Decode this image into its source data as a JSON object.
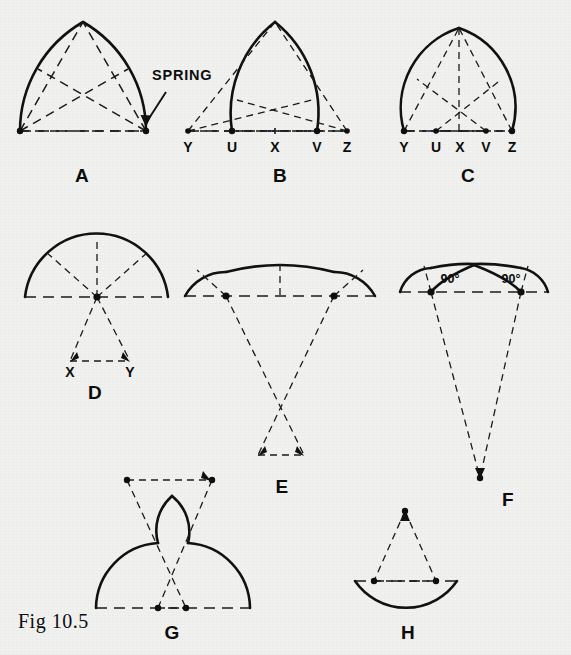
{
  "figure": {
    "caption": "Fig 10.5",
    "background_color": "#f1f1ef",
    "ink_color": "#101010",
    "callouts": [
      {
        "id": "spring",
        "text": "SPRING"
      }
    ],
    "panels": [
      {
        "id": "A",
        "label": "A",
        "description": "Equilateral pointed arch with crossing construction chords",
        "point_labels": []
      },
      {
        "id": "B",
        "label": "B",
        "description": "Lancet (drop) pointed arch struck from centres beyond the springing",
        "point_labels": [
          "Y",
          "U",
          "X",
          "V",
          "Z"
        ]
      },
      {
        "id": "C",
        "label": "C",
        "description": "Drop pointed arch struck from centres inside the span",
        "point_labels": [
          "Y",
          "U",
          "X",
          "V",
          "Z"
        ]
      },
      {
        "id": "D",
        "label": "D",
        "description": "Segmental three-centred arch with centres below the springing line",
        "point_labels": [
          "X",
          "Y"
        ]
      },
      {
        "id": "E",
        "label": "E",
        "description": "Flat three-centred arch with deep centres below the springing line",
        "point_labels": []
      },
      {
        "id": "F",
        "label": "F",
        "description": "Four-centred depressed arch with right-angle tangent construction",
        "point_labels": [],
        "angle_labels": [
          "90°",
          "90°"
        ]
      },
      {
        "id": "G",
        "label": "G",
        "description": "Ogee arch struck from reversed centres above and below the springing",
        "point_labels": []
      },
      {
        "id": "H",
        "label": "H",
        "description": "Inverted segmental arch struck from a centre above the springing line",
        "point_labels": []
      }
    ]
  },
  "geometry": {
    "A": {
      "spring_left": [
        20,
        131
      ],
      "spring_right": [
        146,
        131
      ],
      "apex": [
        83,
        22
      ],
      "baseline_left": [
        20,
        131
      ],
      "baseline_right": [
        146,
        131
      ],
      "callout_text_pos": [
        152,
        84
      ],
      "callout_arrow_from": [
        168,
        92
      ],
      "callout_arrow_to": [
        145,
        126
      ],
      "letter_pos": [
        82,
        176
      ]
    },
    "B": {
      "spring_left": [
        232,
        131
      ],
      "spring_right": [
        317,
        131
      ],
      "apex": [
        275,
        22
      ],
      "center_far_left": [
        188,
        131
      ],
      "center_far_right": [
        347,
        131
      ],
      "labels": {
        "Y": [
          188,
          152
        ],
        "U": [
          232,
          152
        ],
        "X": [
          275,
          152
        ],
        "V": [
          317,
          152
        ],
        "Z": [
          347,
          152
        ]
      },
      "letter_pos": [
        280,
        176
      ]
    },
    "C": {
      "spring_left": [
        404,
        131
      ],
      "spring_right": [
        512,
        131
      ],
      "apex": [
        459,
        28
      ],
      "center_left": [
        436,
        131
      ],
      "center_right": [
        486,
        131
      ],
      "labels": {
        "Y": [
          404,
          152
        ],
        "U": [
          436,
          152
        ],
        "X": [
          460,
          152
        ],
        "V": [
          486,
          152
        ],
        "Z": [
          512,
          152
        ]
      },
      "letter_pos": [
        468,
        176
      ]
    },
    "D": {
      "spring_left": [
        25,
        297
      ],
      "spring_right": [
        168,
        297
      ],
      "apex": [
        97,
        241
      ],
      "centre": [
        97,
        297
      ],
      "labels": {
        "X": [
          70,
          375
        ],
        "Y": [
          130,
          375
        ]
      },
      "lower_left": [
        70,
        361
      ],
      "lower_right": [
        130,
        361
      ],
      "letter_pos": [
        95,
        393
      ]
    },
    "E": {
      "spring_left": [
        185,
        296
      ],
      "spring_right": [
        375,
        296
      ],
      "apex": [
        280,
        264
      ],
      "centre_left": [
        226,
        296
      ],
      "centre_right": [
        334,
        296
      ],
      "lower_left": [
        258,
        455
      ],
      "lower_right": [
        304,
        455
      ],
      "letter_pos": [
        282,
        487
      ]
    },
    "F": {
      "spring_left": [
        400,
        292
      ],
      "spring_right": [
        548,
        292
      ],
      "apex": [
        474,
        264
      ],
      "centre_left": [
        431,
        292
      ],
      "centre_right": [
        521,
        292
      ],
      "deep_centre": [
        480,
        478
      ],
      "angle_left_pos": [
        449,
        278
      ],
      "angle_right_pos": [
        509,
        278
      ],
      "letter_pos": [
        508,
        500
      ]
    },
    "G": {
      "spring_left": [
        96,
        608
      ],
      "spring_right": [
        250,
        608
      ],
      "apex": [
        170,
        495
      ],
      "upper_left": [
        127,
        480
      ],
      "upper_right": [
        212,
        480
      ],
      "lower_left": [
        158,
        608
      ],
      "lower_right": [
        186,
        608
      ],
      "letter_pos": [
        172,
        633
      ]
    },
    "H": {
      "spring_left": [
        355,
        581
      ],
      "spring_right": [
        457,
        581
      ],
      "centre_top": [
        405,
        511
      ],
      "inner_left": [
        374,
        581
      ],
      "inner_right": [
        436,
        581
      ],
      "letter_pos": [
        408,
        633
      ]
    },
    "caption_pos": [
      18,
      621
    ]
  }
}
